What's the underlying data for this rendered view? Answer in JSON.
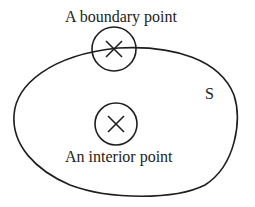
{
  "diagram": {
    "set_label": "S",
    "boundary_label": "A boundary point",
    "interior_label": "An interior point",
    "colors": {
      "stroke": "#1e1e1e",
      "text": "#222222",
      "background": "#ffffff"
    },
    "boundary_point": {
      "cx": 114,
      "cy": 49,
      "r": 22
    },
    "interior_point": {
      "cx": 116,
      "cy": 124,
      "r": 21
    }
  }
}
